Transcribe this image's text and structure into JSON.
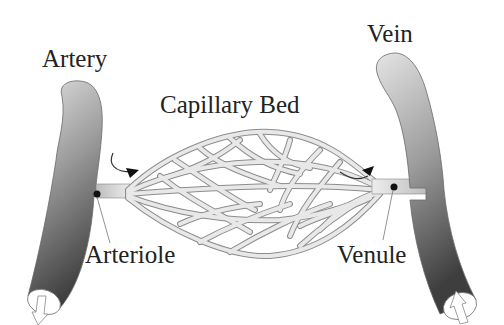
{
  "diagram": {
    "labels": {
      "artery": "Artery",
      "vein": "Vein",
      "capillary_bed": "Capillary Bed",
      "arteriole": "Arteriole",
      "venule": "Venule"
    },
    "flow": [
      "Artery",
      "Arteriole",
      "Capillary Bed",
      "Venule",
      "Vein"
    ],
    "colors": {
      "vessel_light": "#d8d8d8",
      "vessel_dark": "#4a4a4a",
      "capillary": "#e6e6e6",
      "capillary_outline": "#8a8a8a",
      "text": "#222222",
      "marker": "#111111"
    }
  }
}
